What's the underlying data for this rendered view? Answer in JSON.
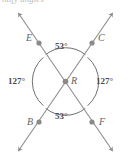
{
  "figure": {
    "title_fragment": "ntify angles",
    "type": "intersecting-lines-vertical-angles",
    "vertex_label": "R",
    "points": [
      {
        "id": "E",
        "label": "E",
        "position": "upper-left"
      },
      {
        "id": "C",
        "label": "C",
        "position": "upper-right"
      },
      {
        "id": "B",
        "label": "B",
        "position": "lower-left"
      },
      {
        "id": "F",
        "label": "F",
        "position": "lower-right"
      }
    ],
    "lines": [
      {
        "id": "line-EF",
        "from": "E",
        "to": "F",
        "arrows": "both"
      },
      {
        "id": "line-CB",
        "from": "C",
        "to": "B",
        "arrows": "both"
      }
    ],
    "angles": [
      {
        "id": "angle-top",
        "value": "53°",
        "position": "top",
        "arc": true
      },
      {
        "id": "angle-right",
        "value": "127°",
        "position": "right",
        "arc": true
      },
      {
        "id": "angle-bottom",
        "value": "53°",
        "position": "bottom",
        "arc": true
      },
      {
        "id": "angle-left",
        "value": "127°",
        "position": "left",
        "arc": true
      }
    ],
    "colors": {
      "stroke": "#8d8d8d",
      "arc": "#6f6f6f",
      "dot": "#8a8a8a",
      "label": "#636363",
      "angle_text": "#4a4a4a",
      "background": "#ffffff"
    }
  }
}
